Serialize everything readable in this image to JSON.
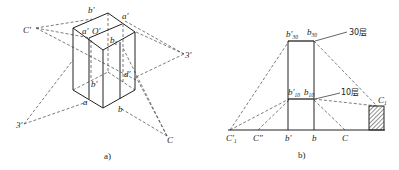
{
  "figure_a": {
    "caption": "a)",
    "labels": {
      "b_prime_top": "b'",
      "a_prime_top": "a'",
      "a_prime_o": "a'",
      "o_prime": "O'",
      "b1": "b",
      "b1_sub": "1",
      "c_prime": "C'",
      "three_prime_right": "3'",
      "three_prime_left": "3'",
      "d_prime": "d'",
      "b_prime_mid": "b'",
      "a": "a",
      "b": "b",
      "c": "C"
    }
  },
  "figure_b": {
    "caption": "b)",
    "labels": {
      "b30_prime": "b'",
      "b30_prime_sub": "30",
      "b30": "b",
      "b30_sub": "30",
      "floor30": "30层",
      "b10_prime": "b'",
      "b10_prime_sub": "10",
      "b10": "b",
      "b10_sub": "10",
      "floor10": "10层",
      "c1": "C",
      "c1_sub": "1",
      "c1_prime": "C'",
      "c1_prime_sub": "1",
      "c_double_prime": "C\"",
      "b_prime": "b'",
      "b": "b",
      "c": "C"
    }
  }
}
